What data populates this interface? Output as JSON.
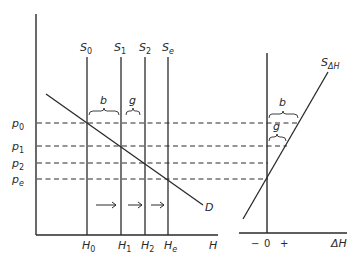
{
  "diagram": {
    "left_panel": {
      "x_axis_label": "H",
      "supply_curves": [
        {
          "name": "S",
          "sub": "0",
          "quantity_label": "H",
          "quantity_sub": "0"
        },
        {
          "name": "S",
          "sub": "1",
          "quantity_label": "H",
          "quantity_sub": "1"
        },
        {
          "name": "S",
          "sub": "2",
          "quantity_label": "H",
          "quantity_sub": "2"
        },
        {
          "name": "S",
          "sub": "e",
          "quantity_label": "H",
          "quantity_sub": "e"
        }
      ],
      "price_levels": [
        {
          "name": "p",
          "sub": "0"
        },
        {
          "name": "p",
          "sub": "1"
        },
        {
          "name": "p",
          "sub": "2"
        },
        {
          "name": "p",
          "sub": "e"
        }
      ],
      "demand_label": "D",
      "gap_labels": {
        "b": "b",
        "g": "g"
      },
      "arrow_count": 3
    },
    "right_panel": {
      "curve_label": "S",
      "curve_sub": "ΔH",
      "x_axis_label": "ΔH",
      "x_ticks": {
        "minus": "−",
        "zero": "0",
        "plus": "+"
      },
      "gap_labels": {
        "b": "b",
        "g": "g"
      }
    }
  }
}
